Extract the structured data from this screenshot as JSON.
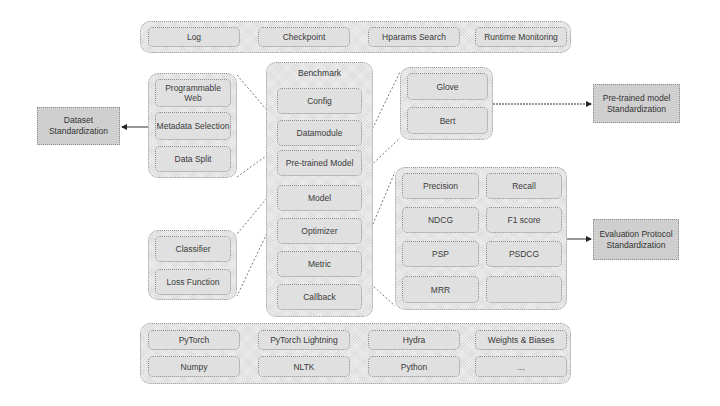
{
  "top_bar": {
    "items": [
      "Log",
      "Checkpoint",
      "Hparams Search",
      "Runtime Monitoring"
    ]
  },
  "data_group": {
    "items": [
      "Programmable Web",
      "Metadata Selection",
      "Data Split"
    ]
  },
  "dataset_std": {
    "label": "Dataset Standardization"
  },
  "benchmark": {
    "title": "Benchmark",
    "items": [
      "Config",
      "Datamodule",
      "Pre-trained Model",
      "Model",
      "Optimizer",
      "Metric",
      "Callback"
    ]
  },
  "pretrained_group": {
    "items": [
      "Glove",
      "Bert"
    ]
  },
  "pretrained_std": {
    "label": "Pre-trained model Standardization"
  },
  "model_group": {
    "items": [
      "Classifier",
      "Loss Function"
    ]
  },
  "metric_group": {
    "items": [
      "Precision",
      "Recall",
      "NDCG",
      "F1 score",
      "PSP",
      "PSDCG",
      "MRR",
      ""
    ]
  },
  "eval_std": {
    "label": "Evaluation Protocol Standardization"
  },
  "bottom_bar": {
    "row1": [
      "PyTorch",
      "PyTorch Lightning",
      "Hydra",
      "Weights & Biases"
    ],
    "row2": [
      "Numpy",
      "NLTK",
      "Python",
      "..."
    ]
  },
  "colors": {
    "box_fill": "#d9d9d9",
    "std_fill": "#cfcfcf",
    "border": "#8f8f8f",
    "text": "#333333"
  }
}
